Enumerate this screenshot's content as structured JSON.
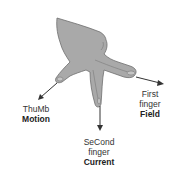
{
  "colors": {
    "hand_fill": "#a9a9a9",
    "hand_stroke": "#6e6e6e",
    "arrow": "#333333",
    "text": "#333333"
  },
  "labels": {
    "thumb": {
      "line1": "ThuMb",
      "bold": "Motion"
    },
    "second_finger": {
      "line1": "SeCond",
      "line2": "finger",
      "bold": "Current"
    },
    "first_finger": {
      "line1": "First",
      "line2": "finger",
      "bold": "Field"
    }
  }
}
